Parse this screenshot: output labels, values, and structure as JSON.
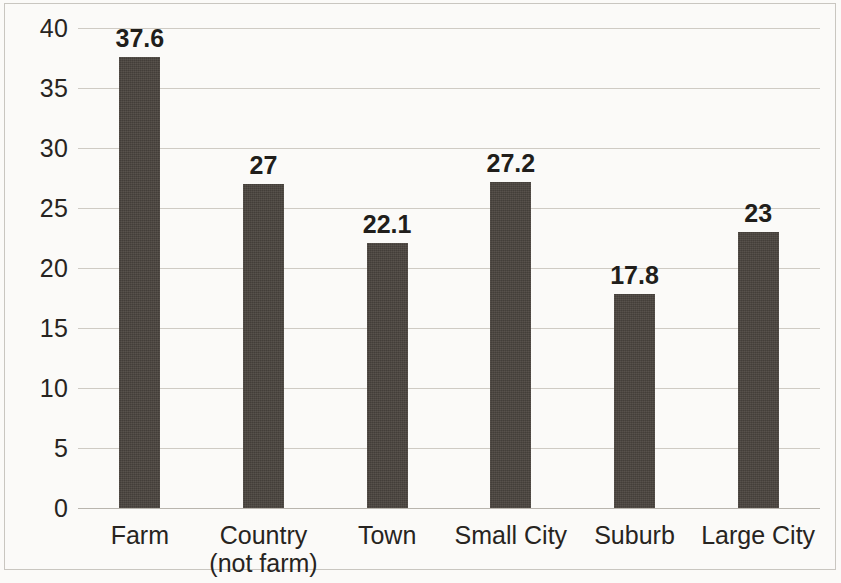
{
  "chart_data": {
    "type": "bar",
    "title": "",
    "subtitle": "",
    "xlabel": "",
    "ylabel": "",
    "categories": [
      "Farm",
      "Country (not farm)",
      "Town",
      "Small City",
      "Suburb",
      "Large City"
    ],
    "values": [
      37.6,
      27,
      22.1,
      27.2,
      17.8,
      23
    ],
    "value_labels": [
      "37.6",
      "27",
      "22.1",
      "27.2",
      "17.8",
      "23"
    ],
    "ylim": [
      0,
      40
    ],
    "y_ticks": [
      0,
      5,
      10,
      15,
      20,
      25,
      30,
      35,
      40
    ],
    "y_tick_labels": [
      "0",
      "5",
      "10",
      "15",
      "20",
      "25",
      "30",
      "35",
      "40"
    ],
    "grid": true,
    "grid_axis": "y",
    "legend": false,
    "legend_position": "none",
    "bar_color": "#4a443e",
    "background_color": "#fbfaf8",
    "gridline_color": "#cfcbc4",
    "text_color": "#272421"
  }
}
